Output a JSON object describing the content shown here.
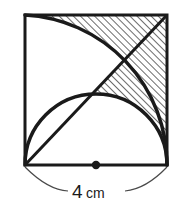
{
  "figure": {
    "background_color": "#ffffff",
    "stroke_color": "#1a1a1a",
    "hatch_color": "#3a3a3a"
  },
  "dimension": {
    "value": "4",
    "unit": "cm",
    "full_label": "4 cm",
    "applies_to": "bottom-side-length"
  },
  "square": {
    "name": "outer-square",
    "left": 25,
    "top": 15,
    "right": 167,
    "bottom": 165,
    "width": 142,
    "height": 150,
    "stroke_width": 3
  },
  "shapes": [
    {
      "name": "quarter-circle-arc",
      "description": "Quarter circle arc centered at bottom-left corner, radius equal to the square side, sweeping from the top-left corner to the bottom-right corner",
      "center": [
        25,
        165
      ],
      "radius": 150,
      "from": [
        25,
        15
      ],
      "to": [
        167,
        165
      ]
    },
    {
      "name": "semicircle-arc",
      "description": "Semicircle drawn on the bottom side of the square as its diameter, bulging upward",
      "center": [
        96,
        165
      ],
      "radius": 71,
      "from": [
        25,
        165
      ],
      "to": [
        167,
        165
      ]
    },
    {
      "name": "main-diagonal",
      "description": "Straight diagonal from the bottom-left corner to the top-right corner",
      "from": [
        25,
        165
      ],
      "to": [
        167,
        15
      ]
    }
  ],
  "center_dot": {
    "name": "bottom-midpoint-dot",
    "position": [
      96,
      165
    ],
    "radius": 4
  },
  "hatched_regions": [
    {
      "name": "upper-hatched-region",
      "description": "Region bounded above by the top edge, on the right by the right edge, below-left by the quarter circle arc, and cut by the diagonal"
    },
    {
      "name": "lower-hatched-lens",
      "description": "Lens shaped region between the diagonal, the semicircle and the quarter circle arc near the bottom-right"
    }
  ],
  "dimension_line": {
    "name": "dimension-arc",
    "from": [
      25,
      167
    ],
    "to": [
      167,
      167
    ],
    "sag": 22
  }
}
